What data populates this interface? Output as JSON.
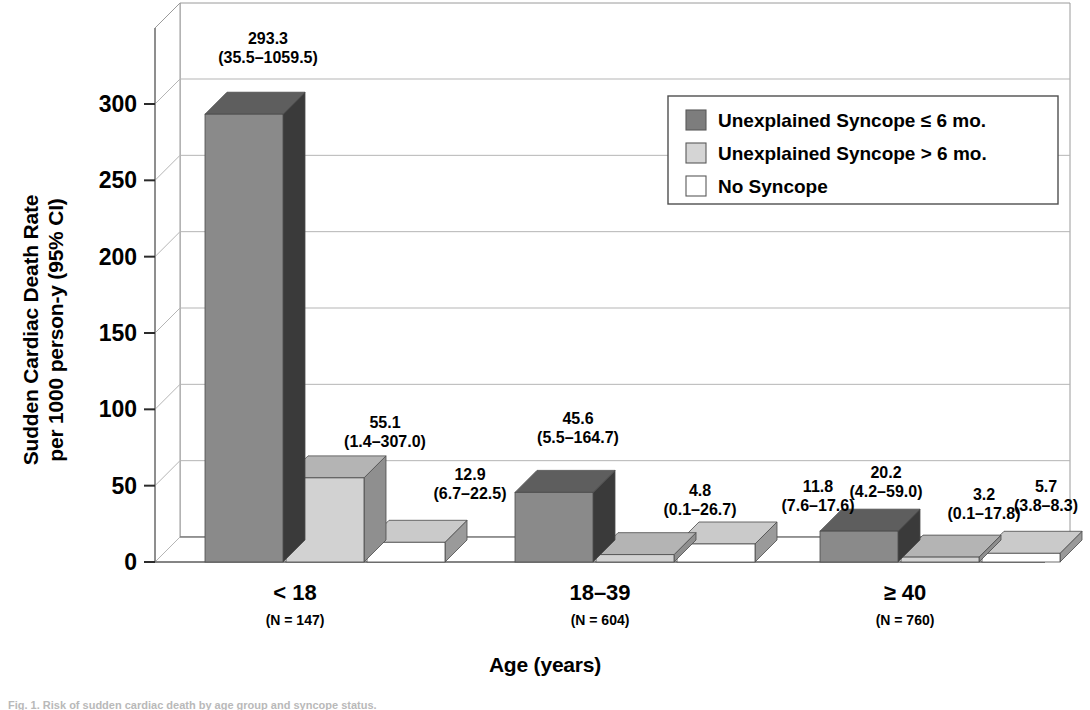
{
  "chart_data": {
    "type": "bar",
    "title": "",
    "xlabel": "Age (years)",
    "ylabel": "Sudden Cardiac Death Rate\nper 1000 person-y (95% CI)",
    "ylabel_line1": "Sudden Cardiac Death Rate",
    "ylabel_line2": "per 1000 person-y (95% CI)",
    "ylim": [
      0,
      300
    ],
    "yticks": [
      "0",
      "50",
      "100",
      "150",
      "200",
      "250",
      "300"
    ],
    "ytick_values": [
      0,
      50,
      100,
      150,
      200,
      250,
      300
    ],
    "grid": true,
    "legend_position": "top-right",
    "categories": [
      "< 18",
      "18–39",
      "≥ 40"
    ],
    "category_sublabels": [
      "(N = 147)",
      "(N = 604)",
      "(N = 760)"
    ],
    "series": [
      {
        "name": "Unexplained Syncope ≤ 6 mo.",
        "color_front": "#8a8a8a",
        "color_side": "#3a3a3a",
        "color_top": "#5e5e5e",
        "legend_swatch": "#7d7d7d",
        "values": [
          293.3,
          45.6,
          20.2
        ],
        "labels": [
          "293.3",
          "45.6",
          "20.2"
        ],
        "ci_labels": [
          "(35.5–1059.5)",
          "(5.5–164.7)",
          "(4.2–59.0)"
        ],
        "ci_low": [
          35.5,
          5.5,
          4.2
        ],
        "ci_high": [
          1059.5,
          164.7,
          59.0
        ]
      },
      {
        "name": "Unexplained Syncope > 6 mo.",
        "color_front": "#d2d2d2",
        "color_side": "#8f8f8f",
        "color_top": "#b4b4b4",
        "legend_swatch": "#d5d5d5",
        "values": [
          55.1,
          4.8,
          3.2
        ],
        "labels": [
          "55.1",
          "4.8",
          "3.2"
        ],
        "ci_labels": [
          "(1.4–307.0)",
          "(0.1–26.7)",
          "(0.1–17.8)"
        ],
        "ci_low": [
          1.4,
          0.1,
          0.1
        ],
        "ci_high": [
          307.0,
          26.7,
          17.8
        ]
      },
      {
        "name": "No Syncope",
        "color_front": "#ffffff",
        "color_side": "#9a9a9a",
        "color_top": "#cacaca",
        "legend_swatch": "#ffffff",
        "values": [
          12.9,
          11.8,
          5.7
        ],
        "labels": [
          "12.9",
          "11.8",
          "5.7"
        ],
        "ci_labels": [
          "(6.7–22.5)",
          "(7.6–17.6)",
          "(3.8–8.3)"
        ],
        "ci_low": [
          6.7,
          7.6,
          3.8
        ],
        "ci_high": [
          22.5,
          17.6,
          8.3
        ]
      }
    ]
  },
  "legend": {
    "items": [
      {
        "label": "Unexplained Syncope ≤ 6 mo."
      },
      {
        "label": "Unexplained Syncope > 6 mo."
      },
      {
        "label": "No Syncope"
      }
    ]
  },
  "caption": {
    "text": "Fig. 1. Risk of sudden cardiac death by age group and syncope status."
  }
}
